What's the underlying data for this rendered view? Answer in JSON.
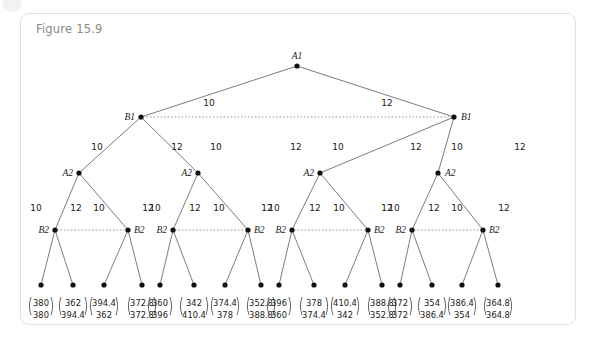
{
  "figure": {
    "title": "Figure 15.9",
    "border_color": "#e2e2e2",
    "background": "#ffffff",
    "title_color": "#8a8a8a"
  },
  "chart_data": {
    "type": "diagram",
    "diagram_kind": "binomial-lattice-decision-tree",
    "title": "Figure 15.9",
    "levels": [
      {
        "depth": 0,
        "node_labels": [
          "A1"
        ]
      },
      {
        "depth": 1,
        "node_labels": [
          "B1",
          "B1"
        ]
      },
      {
        "depth": 2,
        "node_labels": [
          "A2",
          "A2",
          "A2",
          "A2"
        ]
      },
      {
        "depth": 3,
        "node_labels": [
          "B2",
          "B2",
          "B2",
          "B2",
          "B2",
          "B2",
          "B2",
          "B2"
        ]
      },
      {
        "depth": 4,
        "node_labels": [
          "",
          "",
          "",
          "",
          "",
          "",
          "",
          "",
          "",
          "",
          "",
          "",
          "",
          "",
          "",
          ""
        ]
      }
    ],
    "edge_labels": {
      "left": "10",
      "right": "12"
    },
    "dotted_links": [
      {
        "from": "B1-left",
        "to": "B1-right"
      },
      {
        "from": "B2-1",
        "to": "B2-2"
      },
      {
        "from": "B2-3",
        "to": "B2-4"
      },
      {
        "from": "B2-5",
        "to": "B2-6"
      },
      {
        "from": "B2-7",
        "to": "B2-8"
      }
    ],
    "leaf_values": [
      {
        "top": "380",
        "bottom": "380"
      },
      {
        "top": "362",
        "bottom": "394.4"
      },
      {
        "top": "394.4",
        "bottom": "362"
      },
      {
        "top": "372.8",
        "bottom": "372.8"
      },
      {
        "top": "360",
        "bottom": "396"
      },
      {
        "top": "342",
        "bottom": "410.4"
      },
      {
        "top": "374.4",
        "bottom": "378"
      },
      {
        "top": "352.8",
        "bottom": "388.8"
      },
      {
        "top": "396",
        "bottom": "360"
      },
      {
        "top": "378",
        "bottom": "374.4"
      },
      {
        "top": "410.4",
        "bottom": "342"
      },
      {
        "top": "388.8",
        "bottom": "352.8"
      },
      {
        "top": "372",
        "bottom": "372"
      },
      {
        "top": "354",
        "bottom": "386.4"
      },
      {
        "top": "386.4",
        "bottom": "354"
      },
      {
        "top": "364.8",
        "bottom": "364.8"
      }
    ]
  },
  "nodes": {
    "a1": {
      "label": "A1"
    },
    "b1_left": {
      "label": "B1"
    },
    "b1_right": {
      "label": "B1"
    },
    "a2_1": {
      "label": "A2"
    },
    "a2_2": {
      "label": "A2"
    },
    "a2_3": {
      "label": "A2"
    },
    "a2_4": {
      "label": "A2"
    },
    "b2_1": {
      "label": "B2"
    },
    "b2_2": {
      "label": "B2"
    },
    "b2_3": {
      "label": "B2"
    },
    "b2_4": {
      "label": "B2"
    },
    "b2_5": {
      "label": "B2"
    },
    "b2_6": {
      "label": "B2"
    },
    "b2_7": {
      "label": "B2"
    },
    "b2_8": {
      "label": "B2"
    }
  },
  "edges": {
    "lvl1_left": "10",
    "lvl1_right": "12",
    "lvl2_1l": "10",
    "lvl2_1r": "12",
    "lvl2_2l": "10",
    "lvl2_2r": "12",
    "lvl2_3l": "10",
    "lvl2_3r": "12",
    "lvl2_4l": "10",
    "lvl2_4r": "12",
    "lvl3_1l": "10",
    "lvl3_1r": "12",
    "lvl3_2l": "10",
    "lvl3_2r": "12",
    "lvl3_3l": "10",
    "lvl3_3r": "12",
    "lvl3_4l": "10",
    "lvl3_4r": "12",
    "lvl3_5l": "10",
    "lvl3_5r": "12",
    "lvl3_6l": "10",
    "lvl3_6r": "12",
    "lvl3_7l": "10",
    "lvl3_7r": "12",
    "lvl3_8l": "10",
    "lvl3_8r": "12"
  }
}
